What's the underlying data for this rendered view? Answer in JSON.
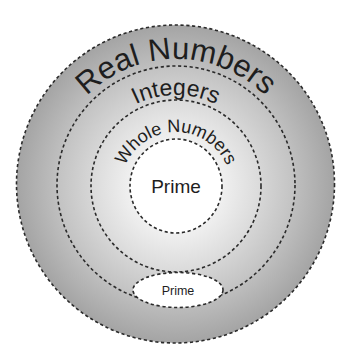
{
  "diagram": {
    "sets": [
      {
        "id": "real",
        "label": "Real Numbers",
        "fill": "#ababab"
      },
      {
        "id": "integers",
        "label": "Integers",
        "fill": "#cfcfcf"
      },
      {
        "id": "whole",
        "label": "Whole Numbers",
        "fill": "#e6e6e6"
      },
      {
        "id": "prime_inner",
        "label": "Prime",
        "fill": "#ffffff"
      },
      {
        "id": "prime_ellipse",
        "label": "Prime",
        "fill": "#ffffff"
      }
    ],
    "colors": {
      "background": "#ffffff",
      "outline": "#2a2a2a",
      "text": "#1e1e1e"
    }
  }
}
